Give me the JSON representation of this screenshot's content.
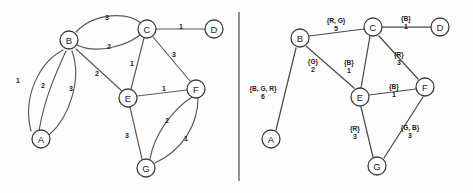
{
  "figure": {
    "divider": "vertical-divider"
  },
  "left_panel": {
    "name": "weighted-multigraph",
    "nodes": [
      {
        "id": "A",
        "label": "A",
        "x": 41,
        "y": 139
      },
      {
        "id": "B",
        "label": "B",
        "x": 69,
        "y": 40
      },
      {
        "id": "C",
        "label": "C",
        "x": 147,
        "y": 29
      },
      {
        "id": "D",
        "label": "D",
        "x": 214,
        "y": 29
      },
      {
        "id": "E",
        "label": "E",
        "x": 128,
        "y": 98
      },
      {
        "id": "F",
        "label": "F",
        "x": 196,
        "y": 89
      },
      {
        "id": "G",
        "label": "G",
        "x": 146,
        "y": 168
      }
    ],
    "edges": [
      {
        "from": "A",
        "to": "B",
        "weight": "1",
        "lx": 18,
        "ly": 80,
        "path": "M 63 50 C 40 62 22 96 31 131"
      },
      {
        "from": "A",
        "to": "B",
        "weight": "2",
        "lx": 43,
        "ly": 85,
        "path": "M 66 51 C 55 75 44 100 39 131"
      },
      {
        "from": "A",
        "to": "B",
        "weight": "3",
        "lx": 71,
        "ly": 88,
        "path": "M 72 51 C 82 78 70 117 49 135"
      },
      {
        "from": "B",
        "to": "C",
        "weight": "3",
        "lx": 107,
        "ly": 17,
        "path": "M 76 32 C 95 12 128 12 141 23"
      },
      {
        "from": "B",
        "to": "C",
        "weight": "2",
        "lx": 109,
        "ly": 46,
        "path": "M 77 45 C 97 55 130 45 142 33"
      },
      {
        "from": "B",
        "to": "E",
        "weight": "2",
        "lx": 97,
        "ly": 73,
        "path": "M 76 49 L 122 91"
      },
      {
        "from": "C",
        "to": "D",
        "weight": "1",
        "lx": 181,
        "ly": 26,
        "path": "M 156 29 L 205 29"
      },
      {
        "from": "C",
        "to": "E",
        "weight": "1",
        "lx": 132,
        "ly": 63,
        "path": "M 144 38 L 131 89"
      },
      {
        "from": "C",
        "to": "F",
        "weight": "3",
        "lx": 174,
        "ly": 54,
        "path": "M 153 37 L 190 81"
      },
      {
        "from": "E",
        "to": "F",
        "weight": "1",
        "lx": 164,
        "ly": 88,
        "path": "M 137 96 L 187 90"
      },
      {
        "from": "E",
        "to": "G",
        "weight": "3",
        "lx": 127,
        "ly": 135,
        "path": "M 130 107 L 142 159"
      },
      {
        "from": "F",
        "to": "G",
        "weight": "2",
        "lx": 167,
        "ly": 120,
        "path": "M 192 97 C 172 110 154 135 150 159"
      },
      {
        "from": "F",
        "to": "G",
        "weight": "1",
        "lx": 186,
        "ly": 138,
        "path": "M 198 98 C 198 124 183 150 155 163"
      }
    ]
  },
  "right_panel": {
    "name": "color-set-labeled-graph",
    "nodes": [
      {
        "id": "A",
        "label": "A",
        "x": 271,
        "y": 139
      },
      {
        "id": "B",
        "label": "B",
        "x": 300,
        "y": 38
      },
      {
        "id": "C",
        "label": "C",
        "x": 373,
        "y": 27
      },
      {
        "id": "D",
        "label": "D",
        "x": 440,
        "y": 27
      },
      {
        "id": "E",
        "label": "E",
        "x": 360,
        "y": 97
      },
      {
        "id": "F",
        "label": "F",
        "x": 425,
        "y": 87
      },
      {
        "id": "G",
        "label": "G",
        "x": 377,
        "y": 166
      }
    ],
    "edges": [
      {
        "from": "A",
        "to": "B",
        "set": "{B, G, R}",
        "weight": "6",
        "lx": 263,
        "ly": 88,
        "wy": 96,
        "path": "M 296 48 L 276 130"
      },
      {
        "from": "B",
        "to": "C",
        "set": "{R, G}",
        "weight": "5",
        "lx": 336,
        "ly": 20,
        "wy": 28,
        "path": "M 309 36 L 364 29"
      },
      {
        "from": "B",
        "to": "E",
        "set": "{G}",
        "weight": "2",
        "lx": 313,
        "ly": 61,
        "wy": 69,
        "path": "M 306 46 L 354 88"
      },
      {
        "from": "C",
        "to": "D",
        "set": "{B}",
        "weight": "1",
        "lx": 406,
        "ly": 18,
        "wy": 26,
        "path": "M 382 27 L 431 27"
      },
      {
        "from": "C",
        "to": "E",
        "set": "{B}",
        "weight": "1",
        "lx": 349,
        "ly": 62,
        "wy": 70,
        "path": "M 370 36 L 361 88"
      },
      {
        "from": "C",
        "to": "F",
        "set": "{R}",
        "weight": "3",
        "lx": 399,
        "ly": 54,
        "wy": 62,
        "path": "M 379 36 L 418 79"
      },
      {
        "from": "E",
        "to": "F",
        "set": "{B}",
        "weight": "1",
        "lx": 394,
        "ly": 86,
        "wy": 94,
        "path": "M 369 95 L 416 89"
      },
      {
        "from": "E",
        "to": "G",
        "set": "{R}",
        "weight": "3",
        "lx": 355,
        "ly": 128,
        "wy": 136,
        "path": "M 361 107 L 373 157"
      },
      {
        "from": "F",
        "to": "G",
        "set": "{G, B}",
        "weight": "3",
        "lx": 410,
        "ly": 127,
        "wy": 135,
        "path": "M 423 97 L 384 158"
      }
    ]
  },
  "colors": {
    "stroke": "#58595b",
    "node_stroke": "#3d3e40",
    "text": "#232323",
    "background": "#ffffff"
  }
}
